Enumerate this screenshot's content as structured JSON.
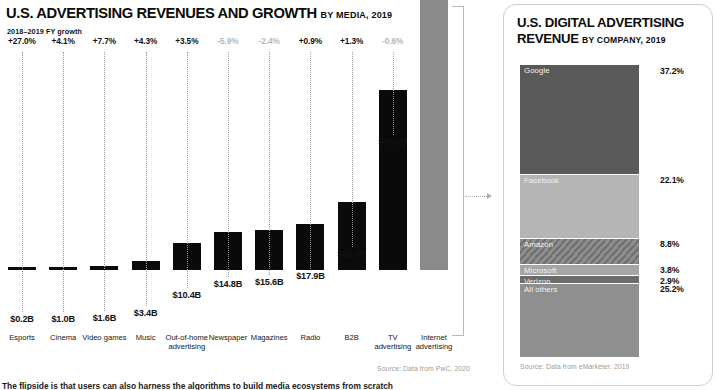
{
  "left": {
    "title_main": "U.S. ADVERTISING REVENUES AND GROWTH",
    "title_sub": "BY MEDIA, 2019",
    "growth_caption": "2018–2019 FY growth",
    "source": "Source: Data from PwC, 2020"
  },
  "right": {
    "title_main": "U.S. DIGITAL ADVERTISING REVENUE",
    "title_sub": "BY COMPANY, 2019",
    "source": "Source: Data from eMarketer, 2019"
  },
  "footer": {
    "cut_text": "The flipside is that users can also harness the algorithms to build media ecosystems from scratch"
  },
  "colors": {
    "bar_black": "#0a0a0a",
    "bar_gray": "#8a8a8a",
    "neg_gray": "#b7b7b7",
    "seg_google": "#595959",
    "seg_facebook": "#b5b5b5",
    "seg_amazon": "#7d7d7d",
    "seg_microsoft": "#a5a5a5",
    "seg_verizon": "#6b6b6b",
    "seg_other": "#8f8f8f"
  },
  "chart_data": [
    {
      "type": "bar",
      "title": "U.S. ADVERTISING REVENUES AND GROWTH BY MEDIA, 2019",
      "xlabel": "",
      "ylabel": "Revenue (USD billions)",
      "ylim": [
        0,
        124.6
      ],
      "grid": false,
      "legend": "none",
      "value_prefix": "$",
      "value_suffix": "B",
      "categories": [
        "Esports",
        "Cinema",
        "Video games",
        "Music",
        "Out-of-home advertising",
        "Newspaper",
        "Magazines",
        "Radio",
        "B2B",
        "TV advertising",
        "Internet advertising"
      ],
      "values": [
        0.2,
        1.0,
        1.6,
        3.4,
        10.4,
        14.8,
        15.6,
        17.9,
        26.5,
        70.6,
        124.6
      ],
      "value_labels": [
        "$0.2B",
        "$1.0B",
        "$1.6B",
        "$3.4B",
        "$10.4B",
        "$14.8B",
        "$15.6B",
        "$17.9B",
        "$26.5B",
        "$70.6B",
        "$124.6B"
      ],
      "growth_labels": [
        "+27.0%",
        "+4.1%",
        "+7.7%",
        "+4.3%",
        "+3.5%",
        "-5.9%",
        "-2.4%",
        "+0.9%",
        "+1.3%",
        "-0.6%",
        "+15.9%"
      ],
      "growth_values": [
        27.0,
        4.1,
        7.7,
        4.3,
        3.5,
        -5.9,
        -2.4,
        0.9,
        1.3,
        -0.6,
        15.9
      ],
      "annotation": "Internet advertising bracket links to U.S. DIGITAL ADVERTISING REVENUE panel"
    },
    {
      "type": "bar",
      "title": "U.S. DIGITAL ADVERTISING REVENUE BY COMPANY, 2019",
      "subtype": "stacked-100",
      "xlabel": "",
      "ylabel": "Share of U.S. digital ad revenue (%)",
      "ylim": [
        0,
        100
      ],
      "grid": false,
      "legend": "inline-labels",
      "categories": [
        "Google",
        "Facebook",
        "Amazon",
        "Microsoft",
        "Verizon",
        "All others"
      ],
      "values": [
        37.2,
        22.1,
        8.8,
        3.8,
        2.9,
        25.2
      ],
      "value_labels": [
        "37.2%",
        "22.1%",
        "8.8%",
        "3.8%",
        "2.9%",
        "25.2%"
      ]
    }
  ]
}
